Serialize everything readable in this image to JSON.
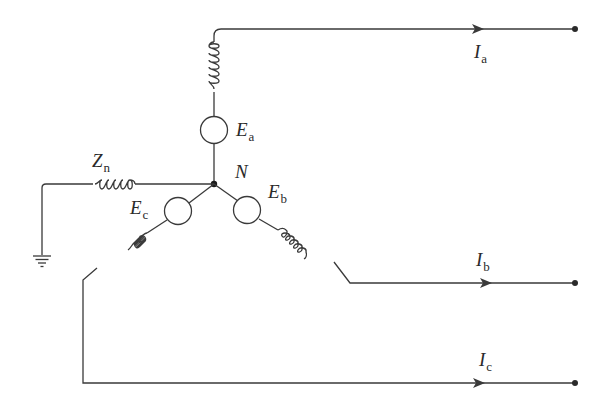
{
  "diagram": {
    "type": "circuit-schematic",
    "colors": {
      "line": "#3a3a3a",
      "background": "#ffffff"
    },
    "labels": {
      "Ea": {
        "main": "E",
        "sub": "a"
      },
      "Eb": {
        "main": "E",
        "sub": "b"
      },
      "Ec": {
        "main": "E",
        "sub": "c"
      },
      "N": {
        "main": "N"
      },
      "Zn": {
        "main": "Z",
        "sub": "n"
      },
      "Ia": {
        "main": "I",
        "sub": "a"
      },
      "Ib": {
        "main": "I",
        "sub": "b"
      },
      "Ic": {
        "main": "I",
        "sub": "c"
      }
    },
    "nodes": [
      "N",
      "terminal-a",
      "terminal-b",
      "terminal-c",
      "ground"
    ],
    "components": [
      {
        "id": "source-a",
        "type": "voltage-source",
        "label": "Ea"
      },
      {
        "id": "source-b",
        "type": "voltage-source",
        "label": "Eb"
      },
      {
        "id": "source-c",
        "type": "voltage-source",
        "label": "Ec"
      },
      {
        "id": "inductor-a",
        "type": "inductor"
      },
      {
        "id": "inductor-b",
        "type": "inductor"
      },
      {
        "id": "inductor-c",
        "type": "inductor"
      },
      {
        "id": "neutral-impedance",
        "type": "inductor",
        "label": "Zn"
      },
      {
        "id": "ground",
        "type": "ground"
      }
    ],
    "currents": [
      {
        "label": "Ia",
        "direction": "right"
      },
      {
        "label": "Ib",
        "direction": "right"
      },
      {
        "label": "Ic",
        "direction": "right"
      }
    ]
  }
}
